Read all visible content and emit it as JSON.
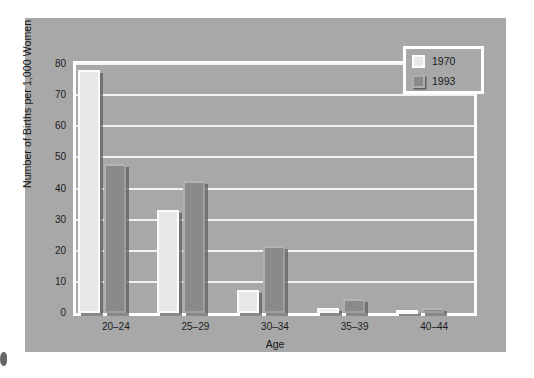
{
  "chart_data": {
    "type": "bar",
    "title": "",
    "xlabel": "Age",
    "ylabel": "Number of Births per 1,000 Women",
    "categories": [
      "20–24",
      "25–29",
      "30–34",
      "35–39",
      "40–44"
    ],
    "series": [
      {
        "name": "1970",
        "values": [
          78,
          33,
          7.5,
          1.5,
          0.5
        ],
        "color": "#e8e8e8"
      },
      {
        "name": "1993",
        "values": [
          48,
          42.5,
          21.5,
          4.5,
          1.5
        ],
        "color": "#8a8a8a"
      }
    ],
    "ylim": [
      0,
      80
    ],
    "yticks": [
      0,
      10,
      20,
      30,
      40,
      50,
      60,
      70,
      80
    ],
    "ytick_labels": [
      "0",
      "10",
      "20",
      "30",
      "40",
      "50",
      "60",
      "70",
      "80"
    ],
    "grid": "horizontal",
    "legend_position": "top-right",
    "plot_background": "#a8a8a8",
    "gridline_color": "#f2f2f2",
    "figure_background": "#ffffff"
  },
  "legend": {
    "entries": [
      {
        "label": "1970",
        "swatch": "legend-swatch-1970"
      },
      {
        "label": "1993",
        "swatch": "legend-swatch-1993"
      }
    ]
  }
}
